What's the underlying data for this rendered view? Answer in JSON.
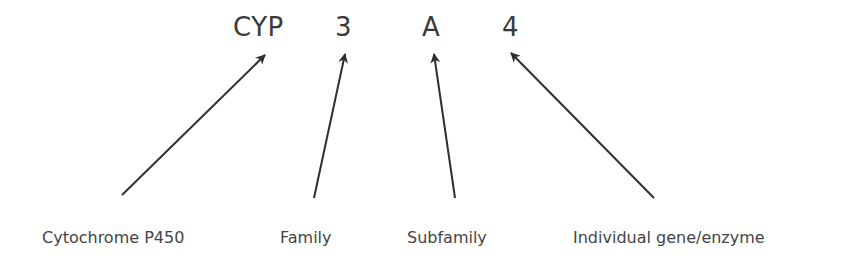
{
  "code_parts": [
    {
      "text": "CYP",
      "x": 233
    },
    {
      "text": "3",
      "x": 335
    },
    {
      "text": "A",
      "x": 422
    },
    {
      "text": "4",
      "x": 502
    }
  ],
  "labels": [
    {
      "text": "Cytochrome P450",
      "x": 42
    },
    {
      "text": "Family",
      "x": 280
    },
    {
      "text": "Subfamily",
      "x": 407
    },
    {
      "text": "Individual gene/enzyme",
      "x": 573
    }
  ],
  "arrows": [
    {
      "name": "cytochrome-arrow",
      "x1": 122,
      "y1": 195,
      "x2": 265,
      "y2": 55
    },
    {
      "name": "family-arrow",
      "x1": 314,
      "y1": 198,
      "x2": 345,
      "y2": 54
    },
    {
      "name": "subfamily-arrow",
      "x1": 455,
      "y1": 198,
      "x2": 434,
      "y2": 54
    },
    {
      "name": "individual-arrow",
      "x1": 654,
      "y1": 198,
      "x2": 511,
      "y2": 53
    }
  ],
  "colors": {
    "ink": "#3a3a3a",
    "arrow": "#2f2f2f"
  }
}
